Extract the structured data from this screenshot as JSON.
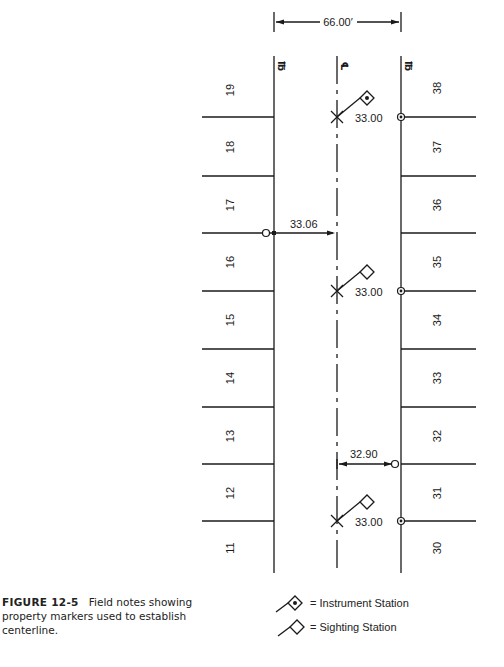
{
  "figure": {
    "label": "FIGURE 12-5",
    "caption": "Field notes showing property markers used to establish centerline."
  },
  "diagram": {
    "row_width_label": "66.00′",
    "left_line_label": "PL",
    "center_line_label": "CL",
    "right_line_label": "PL",
    "left_lots": [
      "19",
      "18",
      "17",
      "16",
      "15",
      "14",
      "13",
      "12",
      "11"
    ],
    "right_lots": [
      "38",
      "37",
      "36",
      "35",
      "34",
      "33",
      "32",
      "31",
      "30"
    ],
    "measurements": {
      "left_offset": "33.06",
      "right_offset": "32.90",
      "station_1_offset": "33.00",
      "station_2_offset": "33.00",
      "station_3_offset": "33.00"
    },
    "stations": [
      {
        "type": "instrument",
        "offset": "33.00"
      },
      {
        "type": "sighting",
        "offset": "33.00"
      },
      {
        "type": "sighting",
        "offset": "33.00"
      }
    ]
  },
  "legend": {
    "instrument_station": "= Instrument Station",
    "sighting_station": "= Sighting Station"
  }
}
